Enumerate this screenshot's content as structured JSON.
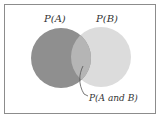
{
  "diagram": {
    "type": "venn",
    "labels": {
      "set_a": "P(A)",
      "set_b": "P(B)",
      "intersection": "P(A and B)"
    },
    "colors": {
      "border": "#8c8c8c",
      "set_a_fill": "#8f8f8f",
      "set_b_fill": "#dcdcdc",
      "intersection_fill": "#b5b5b5",
      "leader_line": "#555555"
    }
  }
}
